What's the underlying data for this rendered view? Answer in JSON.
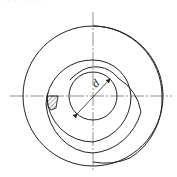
{
  "header": {
    "caption_fragment": "· · · · · · · ·"
  },
  "diagram": {
    "type": "spiral spring technical drawing",
    "dimension_label": "d",
    "line_color": "#222222",
    "hatch_color": "#333333",
    "center": [
      93,
      96
    ]
  }
}
